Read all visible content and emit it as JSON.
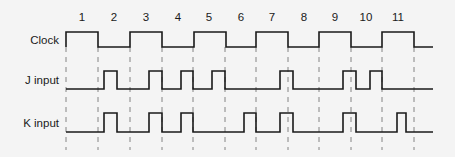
{
  "diagram": {
    "clock_numbers": [
      "1",
      "2",
      "3",
      "4",
      "5",
      "6",
      "7",
      "8",
      "9",
      "10",
      "11"
    ],
    "clock_number_x": [
      82,
      114,
      146,
      178,
      209,
      241,
      272,
      304,
      335,
      366,
      398
    ],
    "dashed_lines_x": [
      66,
      98,
      130,
      162,
      193,
      225,
      256,
      288,
      319,
      351,
      382,
      414
    ],
    "signals": [
      {
        "name": "clock",
        "label": "Clock",
        "label_y": 44,
        "high_y": 32,
        "low_y": 47,
        "start_x": 66,
        "end_x": 433,
        "start_level": "high",
        "transitions_x": [
          98,
          130,
          162,
          194,
          226,
          256,
          288,
          319,
          351,
          382,
          414
        ]
      },
      {
        "name": "j-input",
        "label": "J input",
        "label_y": 84,
        "high_y": 71,
        "low_y": 89,
        "start_x": 66,
        "end_x": 433,
        "start_level": "low",
        "pulses": [
          [
            104,
            117
          ],
          [
            149,
            162
          ],
          [
            181,
            193
          ],
          [
            212,
            225
          ],
          [
            280,
            293
          ],
          [
            343,
            356
          ],
          [
            370,
            382
          ]
        ]
      },
      {
        "name": "k-input",
        "label": "K input",
        "label_y": 127,
        "high_y": 113,
        "low_y": 132,
        "start_x": 66,
        "end_x": 433,
        "start_level": "low",
        "pulses": [
          [
            104,
            117
          ],
          [
            149,
            162
          ],
          [
            181,
            193
          ],
          [
            244,
            256
          ],
          [
            280,
            293
          ],
          [
            343,
            356
          ],
          [
            397,
            406
          ]
        ]
      }
    ]
  }
}
